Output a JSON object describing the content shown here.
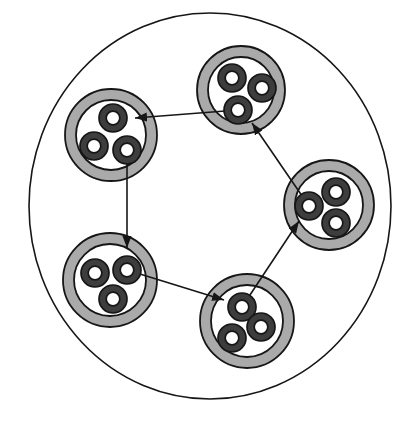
{
  "diagram": {
    "type": "nested-circles-cycle",
    "canvas": {
      "width": 410,
      "height": 421
    },
    "colors": {
      "background": "#ffffff",
      "stroke": "#161616",
      "cluster_ring_fill": "#aaaaaa",
      "cluster_interior_fill": "#ffffff",
      "cell_ring_fill": "#3d3d3d",
      "cell_interior_fill": "#ffffff",
      "arrow": "#161616"
    },
    "outer_boundary": {
      "cx": 210,
      "cy": 206,
      "rx": 181,
      "ry": 193,
      "stroke_width": 1.6
    },
    "cluster_style": {
      "ring_thickness": 11,
      "outer_stroke_width": 1.8,
      "inner_stroke_width": 1.8
    },
    "cell_style": {
      "outer_radius": 14,
      "inner_radius": 6.8,
      "stroke_width": 1.7
    },
    "clusters": [
      {
        "id": "top-left",
        "cx": 111,
        "cy": 135,
        "r": 46,
        "cells": [
          {
            "cx": 113,
            "cy": 118
          },
          {
            "cx": 94,
            "cy": 146
          },
          {
            "cx": 127,
            "cy": 150
          }
        ]
      },
      {
        "id": "top-right",
        "cx": 241,
        "cy": 90,
        "r": 44,
        "cells": [
          {
            "cx": 232,
            "cy": 78
          },
          {
            "cx": 262,
            "cy": 88
          },
          {
            "cx": 238,
            "cy": 110
          }
        ]
      },
      {
        "id": "right",
        "cx": 329,
        "cy": 205,
        "r": 45,
        "cells": [
          {
            "cx": 336,
            "cy": 192
          },
          {
            "cx": 309,
            "cy": 206
          },
          {
            "cx": 336,
            "cy": 223
          }
        ]
      },
      {
        "id": "bottom-left",
        "cx": 110,
        "cy": 280,
        "r": 47,
        "cells": [
          {
            "cx": 95,
            "cy": 273
          },
          {
            "cx": 127,
            "cy": 270
          },
          {
            "cx": 113,
            "cy": 299
          }
        ]
      },
      {
        "id": "bottom",
        "cx": 247,
        "cy": 321,
        "r": 47,
        "cells": [
          {
            "cx": 242,
            "cy": 307
          },
          {
            "cx": 261,
            "cy": 327
          },
          {
            "cx": 232,
            "cy": 338
          }
        ]
      }
    ],
    "arrows": [
      {
        "id": "top-right-to-top-left",
        "x1": 238,
        "y1": 110,
        "x2": 135,
        "y2": 118
      },
      {
        "id": "top-left-to-bottom-left",
        "x1": 127,
        "y1": 150,
        "x2": 127,
        "y2": 248
      },
      {
        "id": "bottom-left-to-bottom",
        "x1": 127,
        "y1": 270,
        "x2": 224,
        "y2": 300
      },
      {
        "id": "bottom-to-right",
        "x1": 242,
        "y1": 307,
        "x2": 299,
        "y2": 221
      },
      {
        "id": "right-to-top-right",
        "x1": 309,
        "y1": 206,
        "x2": 252,
        "y2": 123
      }
    ],
    "arrowhead": {
      "length": 12,
      "width": 9,
      "line_stroke_width": 1.6
    }
  }
}
